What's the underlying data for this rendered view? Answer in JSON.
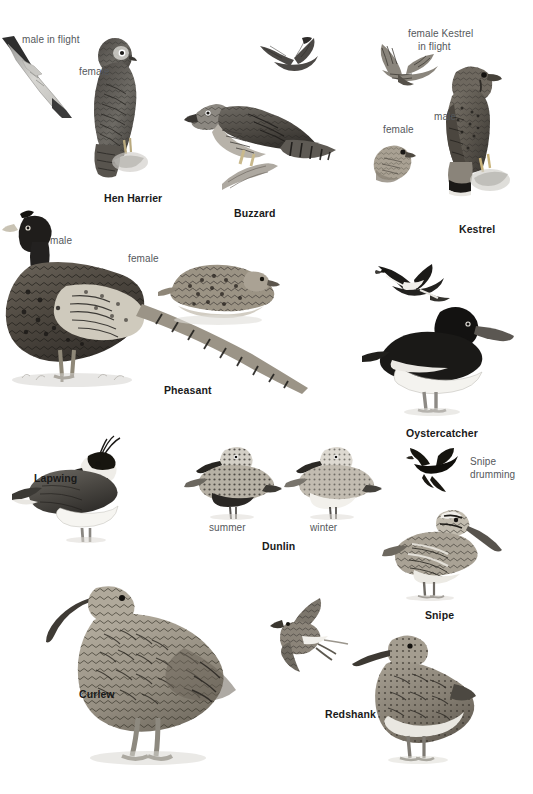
{
  "page": {
    "kind": "bird-field-guide-plate",
    "background_color": "#ffffff",
    "species_label_color": "#1a1a1a",
    "annotation_label_color": "#55585c",
    "illustration_style": "grayscale graphite drawings"
  },
  "species": [
    {
      "id": "hen-harrier",
      "name": "Hen Harrier",
      "name_pos": {
        "x": 104,
        "y": 193
      },
      "annotations": [
        {
          "id": "male-in-flight",
          "text": "male in flight",
          "x": 22,
          "y": 34
        },
        {
          "id": "female",
          "text": "female",
          "x": 79,
          "y": 66
        }
      ],
      "figures": [
        {
          "id": "harrier-male-flight",
          "x": 0,
          "y": 36,
          "w": 72,
          "h": 82
        },
        {
          "id": "harrier-female-perched",
          "x": 66,
          "y": 38,
          "w": 96,
          "h": 140
        }
      ]
    },
    {
      "id": "buzzard",
      "name": "Buzzard",
      "name_pos": {
        "x": 234,
        "y": 208
      },
      "annotations": [],
      "figures": [
        {
          "id": "buzzard-flight",
          "x": 262,
          "y": 35,
          "w": 62,
          "h": 42
        },
        {
          "id": "buzzard-perched",
          "x": 186,
          "y": 88,
          "w": 152,
          "h": 102
        }
      ]
    },
    {
      "id": "kestrel",
      "name": "Kestrel",
      "name_pos": {
        "x": 459,
        "y": 224
      },
      "annotations": [
        {
          "id": "female-kestrel-in-flight-line1",
          "text": "female Kestrel",
          "x": 408,
          "y": 28
        },
        {
          "id": "female-kestrel-in-flight-line2",
          "text": "in flight",
          "x": 418,
          "y": 41
        },
        {
          "id": "male",
          "text": "male",
          "x": 434,
          "y": 111
        },
        {
          "id": "female",
          "text": "female",
          "x": 383,
          "y": 124
        }
      ],
      "figures": [
        {
          "id": "kestrel-female-flight",
          "x": 370,
          "y": 42,
          "w": 74,
          "h": 50
        },
        {
          "id": "kestrel-female-perched",
          "x": 372,
          "y": 138,
          "w": 48,
          "h": 46
        },
        {
          "id": "kestrel-male-perched",
          "x": 438,
          "y": 62,
          "w": 76,
          "h": 132
        }
      ]
    },
    {
      "id": "pheasant",
      "name": "Pheasant",
      "name_pos": {
        "x": 164,
        "y": 385
      },
      "annotations": [
        {
          "id": "male",
          "text": "male",
          "x": 50,
          "y": 235
        },
        {
          "id": "female",
          "text": "female",
          "x": 128,
          "y": 253
        }
      ],
      "figures": [
        {
          "id": "pheasant-male",
          "x": 4,
          "y": 212,
          "w": 300,
          "h": 170
        },
        {
          "id": "pheasant-female",
          "x": 160,
          "y": 262,
          "w": 120,
          "h": 62
        }
      ]
    },
    {
      "id": "oystercatcher",
      "name": "Oystercatcher",
      "name_pos": {
        "x": 406,
        "y": 428
      },
      "annotations": [],
      "figures": [
        {
          "id": "oystercatcher-flight",
          "x": 378,
          "y": 262,
          "w": 72,
          "h": 60
        },
        {
          "id": "oystercatcher-standing",
          "x": 362,
          "y": 300,
          "w": 150,
          "h": 110
        }
      ]
    },
    {
      "id": "lapwing",
      "name": "Lapwing",
      "name_pos": {
        "x": 34,
        "y": 473
      },
      "annotations": [],
      "figures": [
        {
          "id": "lapwing-standing",
          "x": 14,
          "y": 440,
          "w": 120,
          "h": 98
        }
      ]
    },
    {
      "id": "dunlin",
      "name": "Dunlin",
      "name_pos": {
        "x": 262,
        "y": 541
      },
      "annotations": [
        {
          "id": "summer",
          "text": "summer",
          "x": 209,
          "y": 522
        },
        {
          "id": "winter",
          "text": "winter",
          "x": 310,
          "y": 522
        }
      ],
      "figures": [
        {
          "id": "dunlin-summer",
          "x": 186,
          "y": 441,
          "w": 92,
          "h": 74
        },
        {
          "id": "dunlin-winter",
          "x": 286,
          "y": 441,
          "w": 92,
          "h": 74
        }
      ]
    },
    {
      "id": "snipe",
      "name": "Snipe",
      "name_pos": {
        "x": 425,
        "y": 610
      },
      "annotations": [
        {
          "id": "snipe-drumming-line1",
          "text": "Snipe",
          "x": 470,
          "y": 456
        },
        {
          "id": "snipe-drumming-line2",
          "text": "drumming",
          "x": 470,
          "y": 469
        }
      ],
      "figures": [
        {
          "id": "snipe-drumming",
          "x": 408,
          "y": 448,
          "w": 56,
          "h": 44
        },
        {
          "id": "snipe-standing",
          "x": 386,
          "y": 505,
          "w": 110,
          "h": 94
        }
      ]
    },
    {
      "id": "curlew",
      "name": "Curlew",
      "name_pos": {
        "x": 79,
        "y": 689
      },
      "annotations": [],
      "figures": [
        {
          "id": "curlew-standing",
          "x": 38,
          "y": 582,
          "w": 200,
          "h": 180
        }
      ]
    },
    {
      "id": "redshank",
      "name": "Redshank",
      "name_pos": {
        "x": 325,
        "y": 709
      },
      "annotations": [],
      "figures": [
        {
          "id": "redshank-flight",
          "x": 272,
          "y": 600,
          "w": 76,
          "h": 72
        },
        {
          "id": "redshank-standing",
          "x": 350,
          "y": 628,
          "w": 118,
          "h": 132
        }
      ]
    }
  ]
}
